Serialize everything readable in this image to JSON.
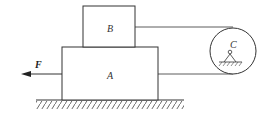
{
  "diagram": {
    "type": "mechanics-free-body",
    "labels": {
      "block_a": "A",
      "block_b": "B",
      "pulley": "C",
      "force": "F"
    },
    "colors": {
      "stroke": "#333333",
      "background": "#ffffff"
    },
    "elements": [
      {
        "id": "block_a",
        "label": "A",
        "shape": "rectangle",
        "rests_on": "ground"
      },
      {
        "id": "block_b",
        "label": "B",
        "shape": "rectangle",
        "rests_on": "block_a"
      },
      {
        "id": "pulley",
        "label": "C",
        "shape": "circle",
        "support": "fixed pin with hatched base"
      },
      {
        "id": "rope",
        "connects": [
          "block_b",
          "pulley",
          "block_a"
        ]
      },
      {
        "id": "force",
        "label": "F",
        "direction": "left",
        "applied_to": "block_a"
      },
      {
        "id": "ground",
        "shape": "hatched line"
      }
    ]
  }
}
